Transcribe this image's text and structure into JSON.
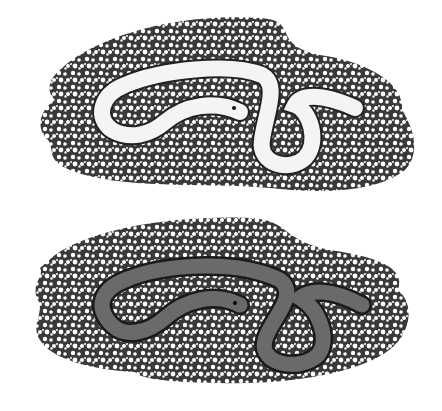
{
  "figure": {
    "panels": [
      {
        "label": "",
        "subject": "pale snake on gravel",
        "snake_color": "#f4f4f4"
      },
      {
        "label": "",
        "subject": "dark snake on gravel",
        "snake_color": "#6a6a6a"
      }
    ],
    "gravel_color": "#3a3a3a",
    "pebble_color": "#ffffff",
    "background": "#ffffff"
  }
}
